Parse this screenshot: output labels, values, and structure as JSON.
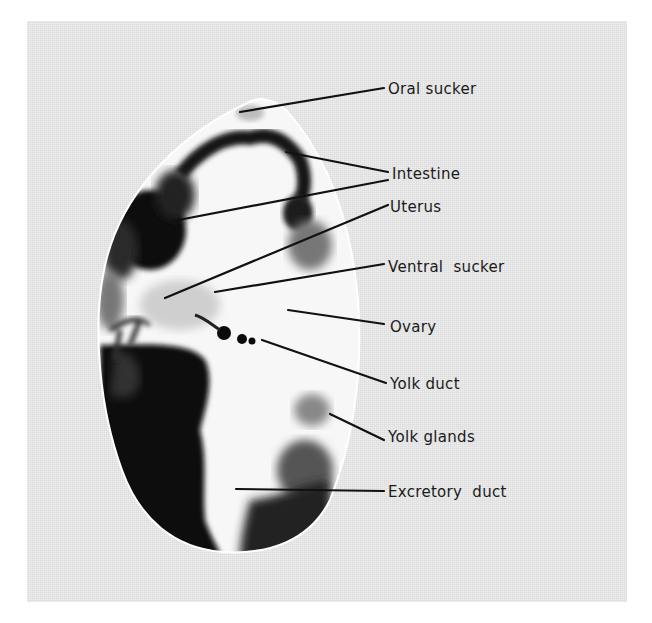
{
  "figure": {
    "background_color": "#e4e4e4",
    "labels": [
      {
        "id": "oral-sucker",
        "text": "Oral sucker",
        "x": 388,
        "y": 80,
        "pointers": [
          [
            240,
            112,
            384,
            88
          ]
        ]
      },
      {
        "id": "intestine",
        "text": "Intestine",
        "x": 392,
        "y": 165,
        "pointers": [
          [
            286,
            152,
            388,
            172
          ],
          [
            168,
            222,
            388,
            180
          ]
        ]
      },
      {
        "id": "uterus",
        "text": "Uterus",
        "x": 390,
        "y": 198,
        "pointers": [
          [
            165,
            298,
            388,
            205
          ]
        ]
      },
      {
        "id": "ventral-sucker",
        "text": "Ventral  sucker",
        "x": 388,
        "y": 258,
        "pointers": [
          [
            215,
            292,
            384,
            264
          ]
        ]
      },
      {
        "id": "ovary",
        "text": "Ovary",
        "x": 390,
        "y": 318,
        "pointers": [
          [
            288,
            310,
            384,
            324
          ]
        ]
      },
      {
        "id": "yolk-duct",
        "text": "Yolk duct",
        "x": 390,
        "y": 375,
        "pointers": [
          [
            262,
            340,
            386,
            383
          ]
        ]
      },
      {
        "id": "yolk-glands",
        "text": "Yolk glands",
        "x": 388,
        "y": 428,
        "pointers": [
          [
            330,
            414,
            384,
            440
          ]
        ]
      },
      {
        "id": "excretory-duct",
        "text": "Excretory  duct",
        "x": 388,
        "y": 483,
        "pointers": [
          [
            236,
            489,
            384,
            491
          ]
        ]
      }
    ]
  }
}
